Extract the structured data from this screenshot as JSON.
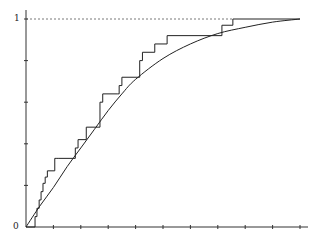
{
  "chart_data": {
    "type": "line",
    "title": "",
    "xlabel": "",
    "ylabel": "",
    "xlim": [
      0,
      10
    ],
    "ylim": [
      0,
      1
    ],
    "grid": false,
    "legend": null,
    "y_tick_labels": [
      "0",
      "1"
    ],
    "y_ticks": [
      0,
      0.2,
      0.4,
      0.6,
      0.8,
      1.0
    ],
    "x_ticks": [
      0,
      1,
      2,
      3,
      4,
      5,
      6,
      7,
      8,
      9,
      10
    ],
    "x_tick_labels": [],
    "reference_line": {
      "y": 1,
      "style": "dashed",
      "x_range": [
        0,
        7.55
      ]
    },
    "series": [
      {
        "name": "empirical CDF (step)",
        "style": "step",
        "x": [
          0,
          0.33,
          0.4,
          0.48,
          0.55,
          0.62,
          0.7,
          0.78,
          1.05,
          1.1,
          1.2,
          1.75,
          1.8,
          1.9,
          2.2,
          2.55,
          2.7,
          2.8,
          3.35,
          3.4,
          3.5,
          3.65,
          4.15,
          4.25,
          4.7,
          5.15,
          7.15,
          7.55,
          10
        ],
        "y": [
          0,
          0.05,
          0.09,
          0.13,
          0.17,
          0.21,
          0.24,
          0.27,
          0.33,
          0.33,
          0.33,
          0.33,
          0.38,
          0.42,
          0.48,
          0.48,
          0.6,
          0.64,
          0.64,
          0.68,
          0.72,
          0.72,
          0.8,
          0.84,
          0.88,
          0.92,
          0.97,
          1.0,
          1.0
        ]
      },
      {
        "name": "theoretical CDF (smooth)",
        "style": "curve",
        "x": [
          0,
          0.5,
          1,
          1.5,
          2,
          2.5,
          3,
          3.5,
          4,
          5,
          6,
          7,
          8,
          9,
          10
        ],
        "y": [
          0,
          0.1,
          0.19,
          0.29,
          0.38,
          0.47,
          0.56,
          0.64,
          0.71,
          0.81,
          0.88,
          0.93,
          0.96,
          0.985,
          1.0
        ]
      }
    ]
  }
}
